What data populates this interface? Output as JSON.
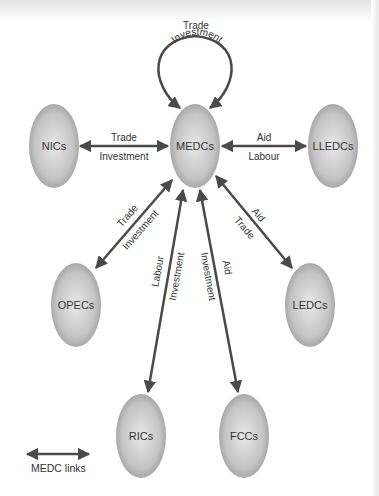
{
  "diagram": {
    "colors": {
      "arrow": "#4a4a4a",
      "node_light": "#e6e6e6",
      "node_dark": "#9a9a9a",
      "text": "#333333"
    },
    "nodes": {
      "medcs": "MEDCs",
      "nics": "NICs",
      "lledcs": "LLEDCs",
      "opecs": "OPECs",
      "ledcs": "LEDCs",
      "rics": "RICs",
      "fccs": "FCCs"
    },
    "links": {
      "self_loop": {
        "outer": "Trade",
        "inner": "Investment"
      },
      "nics": {
        "top": "Trade",
        "bottom": "Investment"
      },
      "lledcs": {
        "top": "Aid",
        "bottom": "Labour"
      },
      "opecs": {
        "top": "Trade",
        "bottom": "Investment"
      },
      "ledcs": {
        "top": "Aid",
        "bottom": "Trade"
      },
      "rics": {
        "left": "Labour",
        "right": "Investment"
      },
      "fccs": {
        "left": "Investment",
        "right": "Aid"
      }
    },
    "legend": {
      "label": "MEDC links"
    }
  }
}
